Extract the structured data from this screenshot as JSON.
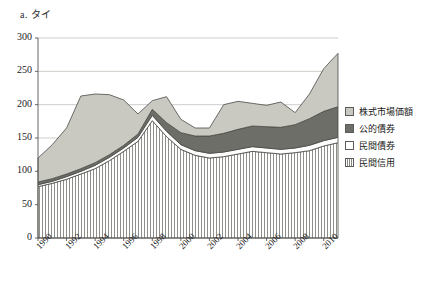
{
  "chart_data": {
    "type": "area",
    "title": "a. タイ",
    "xlabel": "",
    "ylabel": "",
    "ylim": [
      0,
      300
    ],
    "yticks": [
      0,
      50,
      100,
      150,
      200,
      250,
      300
    ],
    "xticks": [
      "1990",
      "1992",
      "1994",
      "1996",
      "1998",
      "2000",
      "2002",
      "2004",
      "2006",
      "2008",
      "2010"
    ],
    "x": [
      1990,
      1991,
      1992,
      1993,
      1994,
      1995,
      1996,
      1997,
      1998,
      1999,
      2000,
      2001,
      2002,
      2003,
      2004,
      2005,
      2006,
      2007,
      2008,
      2009,
      2010,
      2011
    ],
    "grid": true,
    "legend_position": "right",
    "stacked": true,
    "series": [
      {
        "name": "民間信用",
        "key": "private_credit",
        "fill": "hatch-vertical",
        "color": "#ffffff",
        "values": [
          77,
          82,
          88,
          96,
          104,
          116,
          130,
          145,
          176,
          152,
          133,
          124,
          120,
          122,
          126,
          130,
          128,
          126,
          128,
          131,
          138,
          143
        ]
      },
      {
        "name": "民間債券",
        "key": "private_bonds",
        "fill": "solid",
        "color": "#ffffff",
        "values": [
          3,
          3,
          4,
          4,
          5,
          5,
          5,
          6,
          8,
          8,
          7,
          7,
          7,
          7,
          7,
          7,
          7,
          7,
          7,
          8,
          8,
          8
        ]
      },
      {
        "name": "公的債券",
        "key": "public_bonds",
        "fill": "solid",
        "color": "#6e6e68",
        "values": [
          4,
          4,
          4,
          4,
          4,
          4,
          4,
          5,
          9,
          13,
          18,
          22,
          26,
          28,
          30,
          31,
          32,
          33,
          35,
          40,
          44,
          46
        ]
      },
      {
        "name": "株式市場価額",
        "key": "equity_market_value",
        "fill": "solid",
        "color": "#c9c9c2",
        "values": [
          36,
          51,
          69,
          109,
          103,
          90,
          68,
          30,
          13,
          39,
          20,
          12,
          12,
          43,
          42,
          34,
          32,
          38,
          18,
          37,
          64,
          80
        ]
      }
    ],
    "totals": [
      120,
      140,
      165,
      213,
      216,
      215,
      207,
      186,
      206,
      212,
      178,
      165,
      165,
      200,
      205,
      202,
      199,
      204,
      188,
      216,
      254,
      277
    ]
  },
  "legend": {
    "items": [
      {
        "label": "株式市場価額",
        "swatch": "sw-equity"
      },
      {
        "label": "公的債券",
        "swatch": "sw-public"
      },
      {
        "label": "民間債券",
        "swatch": "sw-privbond"
      },
      {
        "label": "民間信用",
        "swatch": "sw-privcredit"
      }
    ]
  }
}
